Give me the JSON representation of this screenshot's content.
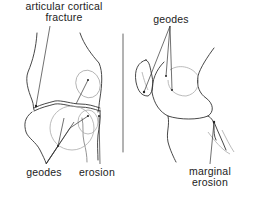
{
  "figure": {
    "panels": [
      {
        "id": "left",
        "view": "frontal joint view",
        "labels": {
          "top": [
            "articular cortical",
            "fracture"
          ],
          "bottom_left": "geodes",
          "bottom_right": "erosion"
        }
      },
      {
        "id": "right",
        "view": "lateral joint view",
        "labels": {
          "top": "geodes",
          "bottom": [
            "marginal",
            "erosion"
          ]
        }
      }
    ],
    "colors": {
      "line": "#333333",
      "light_line": "#aaaaaa",
      "background": "#ffffff",
      "text": "#222222"
    }
  }
}
